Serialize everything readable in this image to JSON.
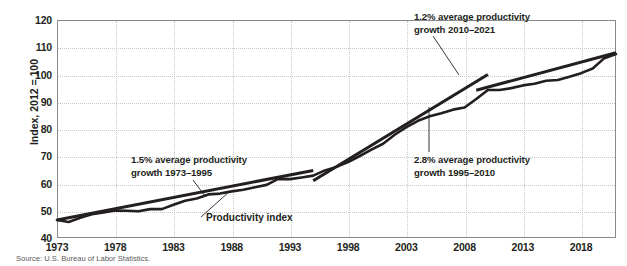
{
  "source_note": "Source: U.S. Bureau of Labor Statistics.",
  "series_label": "Productivity index",
  "annotations": [
    {
      "id": "ann-1973-1995",
      "line1": "1.5% average productivity",
      "line2": "growth 1973–1995"
    },
    {
      "id": "ann-1995-2010",
      "line1": "2.8% average productivity",
      "line2": "growth 1995–2010"
    },
    {
      "id": "ann-2010-2021",
      "line1": "1.2% average productivity",
      "line2": "growth 2010–2021"
    }
  ],
  "chart_data": {
    "type": "line",
    "title": "",
    "xlabel": "",
    "ylabel": "Index, 2012 = 100",
    "xlim": [
      1973,
      2021
    ],
    "ylim": [
      40,
      120
    ],
    "ytick_labels": [
      "40",
      "50",
      "60",
      "70",
      "80",
      "90",
      "100",
      "110",
      "120"
    ],
    "yticks": [
      40,
      50,
      60,
      70,
      80,
      90,
      100,
      110,
      120
    ],
    "xtick_labels": [
      "1973",
      "1978",
      "1983",
      "1988",
      "1993",
      "1998",
      "2003",
      "2008",
      "2013",
      "2018"
    ],
    "xticks": [
      1973,
      1978,
      1983,
      1988,
      1993,
      1998,
      2003,
      2008,
      2013,
      2018
    ],
    "grid": true,
    "legend": "none",
    "line_color": "#231f20",
    "grid_color": "#c9c9c9",
    "axis_color": "#8a8a8a",
    "series": [
      {
        "name": "Productivity index",
        "x": [
          1973,
          1974,
          1975,
          1976,
          1977,
          1978,
          1979,
          1980,
          1981,
          1982,
          1983,
          1984,
          1985,
          1986,
          1987,
          1988,
          1989,
          1990,
          1991,
          1992,
          1993,
          1994,
          1995,
          1996,
          1997,
          1998,
          1999,
          2000,
          2001,
          2002,
          2003,
          2004,
          2005,
          2006,
          2007,
          2008,
          2009,
          2010,
          2011,
          2012,
          2013,
          2014,
          2015,
          2016,
          2017,
          2018,
          2019,
          2020,
          2021
        ],
        "values": [
          46.6,
          45.9,
          47.4,
          48.7,
          49.4,
          50.1,
          50.0,
          49.8,
          50.6,
          50.6,
          52.2,
          53.7,
          54.5,
          56.0,
          56.3,
          57.1,
          57.7,
          58.6,
          59.5,
          61.7,
          61.6,
          62.2,
          62.9,
          64.8,
          66.1,
          67.9,
          70.1,
          72.4,
          74.6,
          77.9,
          80.7,
          83.0,
          84.7,
          85.8,
          87.1,
          87.9,
          91.0,
          94.3,
          94.3,
          95.0,
          96.0,
          96.6,
          97.7,
          98.0,
          99.2,
          100.5,
          102.2,
          106.0,
          107.5
        ]
      }
    ],
    "trend_lines": [
      {
        "name": "1.5% average productivity growth 1973–1995",
        "rate_pct": 1.5,
        "x_start": 1973,
        "x_end": 1995,
        "y_start": 46.6,
        "y_end": 64.8
      },
      {
        "name": "2.8% average productivity growth 1995–2010",
        "rate_pct": 2.8,
        "x_start": 1995,
        "x_end": 2010,
        "y_start": 61.0,
        "y_end": 100.0
      },
      {
        "name": "1.2% average productivity growth 2010–2021",
        "rate_pct": 1.2,
        "x_start": 2009,
        "x_end": 2021,
        "y_start": 94.2,
        "y_end": 108.0
      }
    ]
  }
}
